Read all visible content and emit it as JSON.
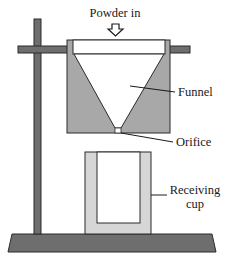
{
  "diagram": {
    "labels": {
      "powder_in": "Powder in",
      "funnel": "Funnel",
      "orifice": "Orifice",
      "receiving_cup_line1": "Receiving",
      "receiving_cup_line2": "cup"
    },
    "colors": {
      "stand": "#6e6e6e",
      "funnel_body": "#a8a8a8",
      "cup_wall": "#d6d6d6",
      "outline": "#2a2a2a",
      "background": "#ffffff"
    },
    "components": [
      "stand-base",
      "stand-pole",
      "clamp-bar",
      "funnel",
      "orifice",
      "receiving-cup",
      "inlet-arrow"
    ]
  }
}
